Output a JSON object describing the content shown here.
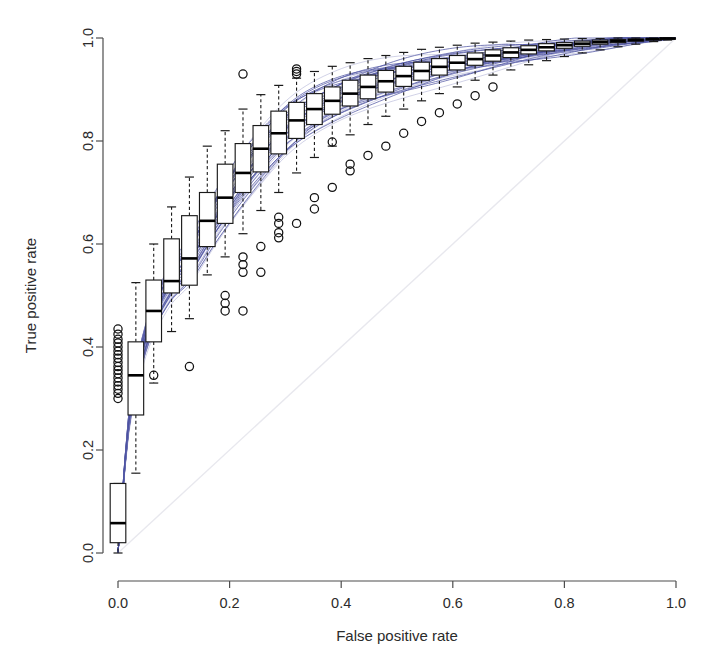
{
  "chart_data": {
    "type": "line",
    "title": "",
    "subtitle": "",
    "xlabel": "False positive rate",
    "ylabel": "True positive rate",
    "xlim": [
      0.0,
      1.0
    ],
    "ylim": [
      0.0,
      1.0
    ],
    "grid": false,
    "legend": null,
    "xticks": [
      0.0,
      0.2,
      0.4,
      0.6,
      0.8,
      1.0
    ],
    "xtick_labels": [
      "0.0",
      "0.2",
      "0.4",
      "0.6",
      "0.8",
      "1.0"
    ],
    "yticks": [
      0.0,
      0.2,
      0.4,
      0.6,
      0.8,
      1.0
    ],
    "ytick_labels": [
      "0.0",
      "0.2",
      "0.4",
      "0.6",
      "0.8",
      "1.0"
    ],
    "colors": {
      "curve": "#4a4fa0",
      "curve_light": "#8f92c4",
      "box_outline": "#1a1a1a",
      "box_fill": "#ffffff",
      "median": "#000000",
      "whisker": "#1a1a1a",
      "outlier": "#111111",
      "axis": "#4d4d4d",
      "diagonal": "#e8e8ee",
      "background": "#ffffff"
    },
    "annotations": [],
    "boxplots": {
      "orientation": "vertical",
      "box_width_fpr": 0.028,
      "whisker_style": "dashed",
      "stats_keys": [
        "x",
        "lower_whisker",
        "q1",
        "median",
        "q3",
        "upper_whisker",
        "outliers"
      ],
      "stats": [
        {
          "x": 0.0,
          "lower_whisker": 0.0,
          "q1": 0.02,
          "median": 0.058,
          "q3": 0.135,
          "upper_whisker": 0.135,
          "outliers": [
            0.3,
            0.31,
            0.318,
            0.325,
            0.332,
            0.34,
            0.348,
            0.355,
            0.362,
            0.37,
            0.378,
            0.385,
            0.392,
            0.4,
            0.408,
            0.415,
            0.425,
            0.435
          ]
        },
        {
          "x": 0.032,
          "lower_whisker": 0.155,
          "q1": 0.268,
          "median": 0.345,
          "q3": 0.41,
          "upper_whisker": 0.525,
          "outliers": []
        },
        {
          "x": 0.064,
          "lower_whisker": 0.33,
          "q1": 0.41,
          "median": 0.47,
          "q3": 0.53,
          "upper_whisker": 0.6,
          "outliers": [
            0.345
          ]
        },
        {
          "x": 0.096,
          "lower_whisker": 0.43,
          "q1": 0.505,
          "median": 0.528,
          "q3": 0.61,
          "upper_whisker": 0.672,
          "outliers": []
        },
        {
          "x": 0.128,
          "lower_whisker": 0.455,
          "q1": 0.52,
          "median": 0.572,
          "q3": 0.655,
          "upper_whisker": 0.73,
          "outliers": [
            0.362
          ]
        },
        {
          "x": 0.16,
          "lower_whisker": 0.54,
          "q1": 0.595,
          "median": 0.645,
          "q3": 0.7,
          "upper_whisker": 0.79,
          "outliers": []
        },
        {
          "x": 0.192,
          "lower_whisker": 0.575,
          "q1": 0.64,
          "median": 0.69,
          "q3": 0.755,
          "upper_whisker": 0.82,
          "outliers": [
            0.47,
            0.485,
            0.5
          ]
        },
        {
          "x": 0.224,
          "lower_whisker": 0.62,
          "q1": 0.7,
          "median": 0.738,
          "q3": 0.795,
          "upper_whisker": 0.862,
          "outliers": [
            0.47,
            0.545,
            0.56,
            0.575,
            0.93
          ]
        },
        {
          "x": 0.256,
          "lower_whisker": 0.665,
          "q1": 0.74,
          "median": 0.785,
          "q3": 0.83,
          "upper_whisker": 0.89,
          "outliers": [
            0.545,
            0.595
          ]
        },
        {
          "x": 0.288,
          "lower_whisker": 0.7,
          "q1": 0.775,
          "median": 0.815,
          "q3": 0.858,
          "upper_whisker": 0.908,
          "outliers": [
            0.612,
            0.622,
            0.64,
            0.652
          ]
        },
        {
          "x": 0.32,
          "lower_whisker": 0.738,
          "q1": 0.805,
          "median": 0.84,
          "q3": 0.875,
          "upper_whisker": 0.922,
          "outliers": [
            0.64,
            0.93,
            0.935,
            0.94
          ]
        },
        {
          "x": 0.352,
          "lower_whisker": 0.768,
          "q1": 0.832,
          "median": 0.862,
          "q3": 0.892,
          "upper_whisker": 0.935,
          "outliers": [
            0.668,
            0.69
          ]
        },
        {
          "x": 0.384,
          "lower_whisker": 0.79,
          "q1": 0.852,
          "median": 0.878,
          "q3": 0.905,
          "upper_whisker": 0.945,
          "outliers": [
            0.71,
            0.798
          ]
        },
        {
          "x": 0.416,
          "lower_whisker": 0.812,
          "q1": 0.868,
          "median": 0.892,
          "q3": 0.918,
          "upper_whisker": 0.952,
          "outliers": [
            0.742,
            0.755
          ]
        },
        {
          "x": 0.448,
          "lower_whisker": 0.832,
          "q1": 0.882,
          "median": 0.905,
          "q3": 0.928,
          "upper_whisker": 0.96,
          "outliers": [
            0.772
          ]
        },
        {
          "x": 0.48,
          "lower_whisker": 0.848,
          "q1": 0.895,
          "median": 0.916,
          "q3": 0.937,
          "upper_whisker": 0.966,
          "outliers": [
            0.79
          ]
        },
        {
          "x": 0.512,
          "lower_whisker": 0.862,
          "q1": 0.906,
          "median": 0.926,
          "q3": 0.945,
          "upper_whisker": 0.972,
          "outliers": [
            0.815
          ]
        },
        {
          "x": 0.544,
          "lower_whisker": 0.878,
          "q1": 0.918,
          "median": 0.936,
          "q3": 0.953,
          "upper_whisker": 0.978,
          "outliers": [
            0.838
          ]
        },
        {
          "x": 0.576,
          "lower_whisker": 0.892,
          "q1": 0.928,
          "median": 0.944,
          "q3": 0.96,
          "upper_whisker": 0.982,
          "outliers": [
            0.855
          ]
        },
        {
          "x": 0.608,
          "lower_whisker": 0.905,
          "q1": 0.938,
          "median": 0.952,
          "q3": 0.966,
          "upper_whisker": 0.986,
          "outliers": [
            0.872
          ]
        },
        {
          "x": 0.64,
          "lower_whisker": 0.918,
          "q1": 0.947,
          "median": 0.959,
          "q3": 0.971,
          "upper_whisker": 0.99,
          "outliers": [
            0.888
          ]
        },
        {
          "x": 0.672,
          "lower_whisker": 0.928,
          "q1": 0.955,
          "median": 0.966,
          "q3": 0.977,
          "upper_whisker": 0.992,
          "outliers": [
            0.905
          ]
        },
        {
          "x": 0.704,
          "lower_whisker": 0.938,
          "q1": 0.962,
          "median": 0.972,
          "q3": 0.981,
          "upper_whisker": 0.994,
          "outliers": []
        },
        {
          "x": 0.736,
          "lower_whisker": 0.948,
          "q1": 0.969,
          "median": 0.977,
          "q3": 0.985,
          "upper_whisker": 0.996,
          "outliers": []
        },
        {
          "x": 0.768,
          "lower_whisker": 0.956,
          "q1": 0.975,
          "median": 0.982,
          "q3": 0.989,
          "upper_whisker": 0.997,
          "outliers": []
        },
        {
          "x": 0.8,
          "lower_whisker": 0.964,
          "q1": 0.98,
          "median": 0.986,
          "q3": 0.991,
          "upper_whisker": 0.998,
          "outliers": []
        },
        {
          "x": 0.832,
          "lower_whisker": 0.971,
          "q1": 0.984,
          "median": 0.989,
          "q3": 0.994,
          "upper_whisker": 0.999,
          "outliers": []
        },
        {
          "x": 0.864,
          "lower_whisker": 0.977,
          "q1": 0.988,
          "median": 0.992,
          "q3": 0.996,
          "upper_whisker": 0.999,
          "outliers": []
        },
        {
          "x": 0.896,
          "lower_whisker": 0.983,
          "q1": 0.991,
          "median": 0.994,
          "q3": 0.997,
          "upper_whisker": 1.0,
          "outliers": []
        },
        {
          "x": 0.928,
          "lower_whisker": 0.988,
          "q1": 0.994,
          "median": 0.996,
          "q3": 0.998,
          "upper_whisker": 1.0,
          "outliers": []
        },
        {
          "x": 0.96,
          "lower_whisker": 0.993,
          "q1": 0.996,
          "median": 0.998,
          "q3": 0.999,
          "upper_whisker": 1.0,
          "outliers": []
        },
        {
          "x": 0.985,
          "lower_whisker": 0.996,
          "q1": 0.998,
          "median": 0.999,
          "q3": 1.0,
          "upper_whisker": 1.0,
          "outliers": []
        }
      ]
    },
    "curves": {
      "count": 40,
      "note": "Each curve is a concave ROC curve through (0,0) and (1,1); family spread generated from the boxplot quartile envelope.",
      "anchor_x": [
        0.0,
        0.02,
        0.05,
        0.09,
        0.13,
        0.18,
        0.24,
        0.31,
        0.39,
        0.48,
        0.58,
        0.69,
        0.8,
        0.9,
        1.0
      ],
      "median_curve_y": [
        0.0,
        0.26,
        0.42,
        0.52,
        0.575,
        0.665,
        0.755,
        0.835,
        0.888,
        0.925,
        0.95,
        0.97,
        0.985,
        0.994,
        1.0
      ],
      "spread_low_y": [
        0.0,
        0.14,
        0.3,
        0.41,
        0.465,
        0.555,
        0.65,
        0.745,
        0.815,
        0.868,
        0.91,
        0.943,
        0.968,
        0.986,
        1.0
      ],
      "spread_high_y": [
        0.0,
        0.4,
        0.56,
        0.64,
        0.695,
        0.775,
        0.85,
        0.91,
        0.945,
        0.968,
        0.982,
        0.991,
        0.996,
        0.999,
        1.0
      ]
    },
    "reference_line": {
      "from": [
        0.0,
        0.0
      ],
      "to": [
        1.0,
        1.0
      ],
      "style": "solid",
      "label": "chance diagonal"
    }
  },
  "axes": {
    "x_title": "False positive rate",
    "y_title": "True positive rate"
  }
}
